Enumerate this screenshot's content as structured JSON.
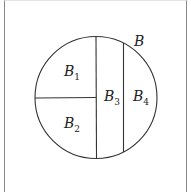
{
  "diagram": {
    "type": "set-partition",
    "set_label": "B",
    "regions": [
      {
        "id": "B1",
        "base": "B",
        "subscript": "1"
      },
      {
        "id": "B2",
        "base": "B",
        "subscript": "2"
      },
      {
        "id": "B3",
        "base": "B",
        "subscript": "3"
      },
      {
        "id": "B4",
        "base": "B",
        "subscript": "4"
      }
    ],
    "colors": {
      "stroke": "#333333",
      "frame": "#8a8a8a",
      "background": "#ffffff"
    }
  }
}
